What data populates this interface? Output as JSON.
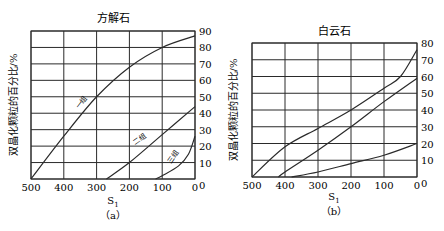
{
  "chart_data": [
    {
      "type": "line",
      "title": "方解石",
      "caption": "(a)",
      "xlabel": "S1",
      "ylabel": "双晶化颗粒的百分比/%",
      "xlim": [
        500,
        0
      ],
      "ylim": [
        0,
        90
      ],
      "x_ticks": [
        "500",
        "400",
        "300",
        "200",
        "100",
        "0"
      ],
      "y_ticks": [
        "0",
        "10",
        "20",
        "30",
        "40",
        "50",
        "60",
        "70",
        "80",
        "90"
      ],
      "grid": true,
      "legend": "inline curve labels",
      "series": [
        {
          "name": "一组",
          "x": [
            500,
            400,
            300,
            200,
            100,
            0
          ],
          "y": [
            0,
            26,
            50,
            68,
            80,
            87
          ]
        },
        {
          "name": "二组",
          "x": [
            270,
            200,
            100,
            0
          ],
          "y": [
            0,
            10,
            27,
            44
          ]
        },
        {
          "name": "三组",
          "x": [
            120,
            100,
            50,
            20,
            0
          ],
          "y": [
            0,
            2,
            8,
            15,
            26
          ]
        }
      ]
    },
    {
      "type": "line",
      "title": "白云石",
      "caption": "(b)",
      "xlabel": "S1",
      "ylabel": "双晶化颗粒的百分比/%",
      "xlim": [
        500,
        0
      ],
      "ylim": [
        0,
        80
      ],
      "x_ticks": [
        "500",
        "400",
        "300",
        "200",
        "100",
        "0"
      ],
      "y_ticks": [
        "0",
        "10",
        "20",
        "30",
        "40",
        "50",
        "60",
        "70",
        "80"
      ],
      "grid": true,
      "series": [
        {
          "name": "curve-1",
          "x": [
            500,
            400,
            300,
            200,
            100,
            50,
            0
          ],
          "y": [
            0,
            18,
            29,
            40,
            53,
            60,
            76
          ]
        },
        {
          "name": "curve-2",
          "x": [
            420,
            400,
            300,
            200,
            100,
            0
          ],
          "y": [
            0,
            3,
            16,
            30,
            45,
            59
          ]
        },
        {
          "name": "curve-3",
          "x": [
            380,
            300,
            200,
            100,
            0
          ],
          "y": [
            0,
            3,
            8,
            13,
            20
          ]
        }
      ]
    }
  ],
  "panels": {
    "a": {
      "title": "方解石",
      "caption": "（a）",
      "xlabel": "S",
      "xlabel_sub": "1",
      "ylabel": "双晶化颗粒的百分比/%",
      "curve_labels": [
        "一组",
        "二组",
        "三组"
      ]
    },
    "b": {
      "title": "白云石",
      "caption": "（b）",
      "xlabel": "S",
      "xlabel_sub": "1",
      "ylabel": "双晶化颗粒的百分比/%"
    }
  }
}
